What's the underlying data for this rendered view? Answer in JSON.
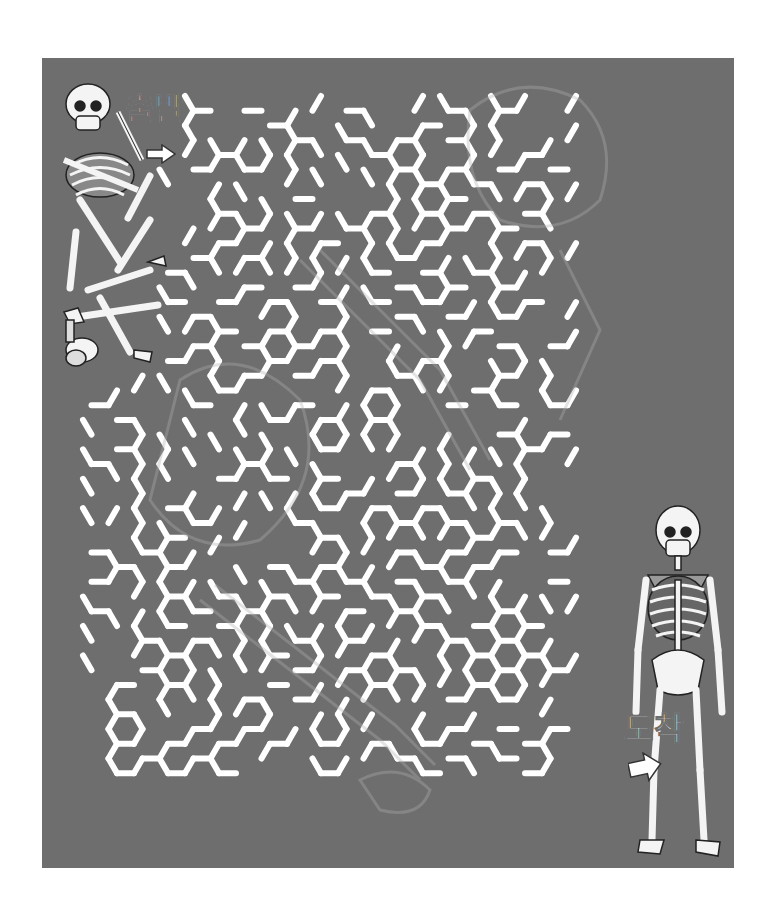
{
  "puzzle": {
    "type": "hexagonal-maze",
    "theme": "skeleton",
    "start_label": "출발",
    "end_label": "도착"
  },
  "colors": {
    "page_background": "#ffffff",
    "panel_background": "#6e6e6e",
    "maze_wall": "#ffffff",
    "watermark": "#8a8a8a",
    "bone": "#f4f4f4",
    "bone_outline": "#222222"
  },
  "maze": {
    "cell_shape": "flat-top-hexagon",
    "approx_columns": 19,
    "approx_rows": 23,
    "wall_thickness_px": 6
  },
  "illustrations": {
    "start": "scattered-skeleton-bones",
    "end": "assembled-standing-skeleton",
    "background": "faint-skeleton-outline-watermark"
  }
}
